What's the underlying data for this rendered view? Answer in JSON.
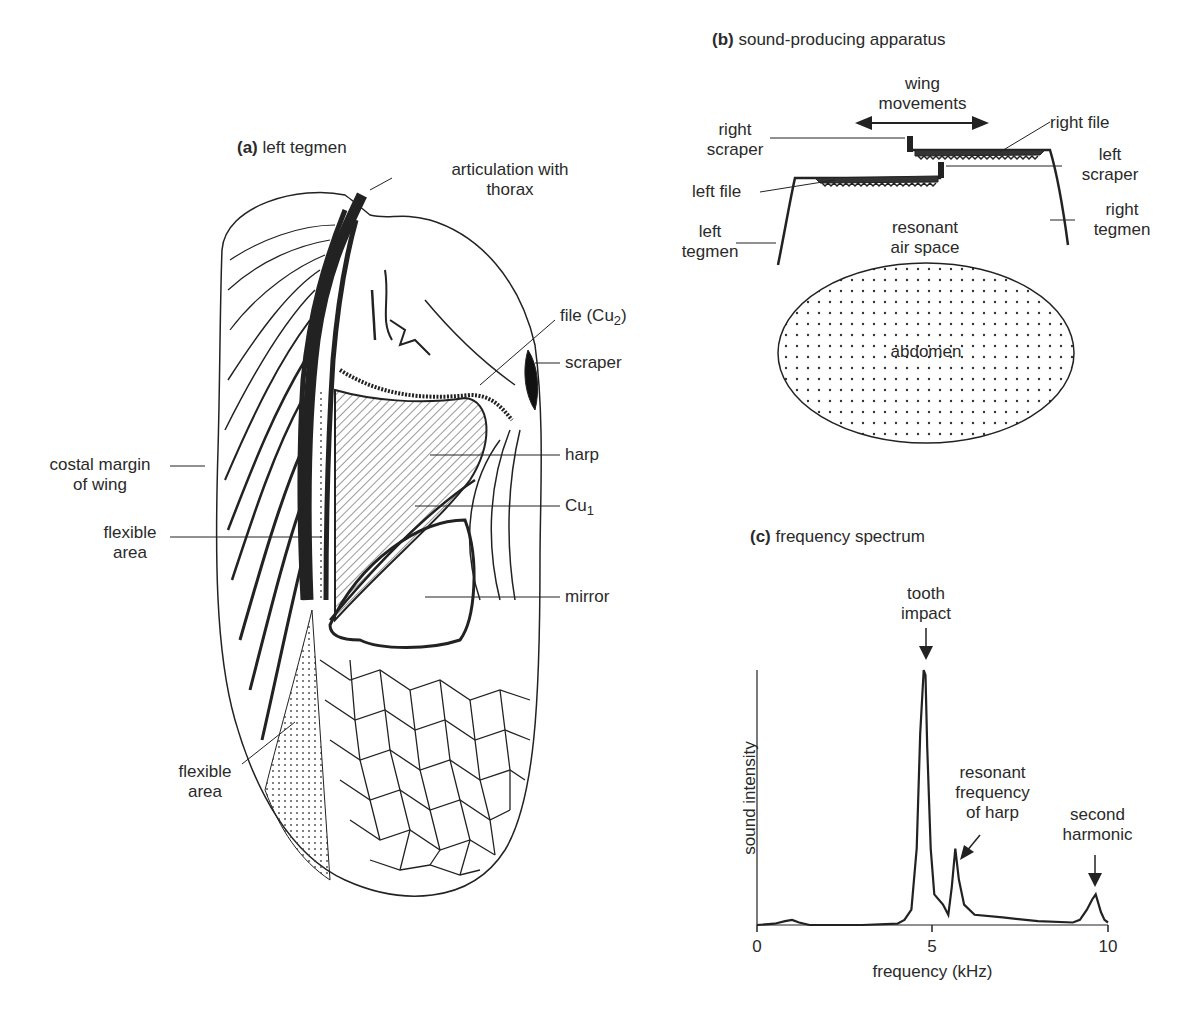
{
  "panel_a": {
    "title_prefix": "(a)",
    "title": "left tegmen",
    "labels": {
      "articulation_1": "articulation with",
      "articulation_2": "thorax",
      "file": "file (Cu",
      "file_sub": "2",
      "file_close": ")",
      "scraper": "scraper",
      "harp": "harp",
      "cu1": "Cu",
      "cu1_sub": "1",
      "mirror": "mirror",
      "costal_1": "costal margin",
      "costal_2": "of wing",
      "flexible_upper_1": "flexible",
      "flexible_upper_2": "area",
      "flexible_lower_1": "flexible",
      "flexible_lower_2": "area"
    }
  },
  "panel_b": {
    "title_prefix": "(b)",
    "title": "sound-producing apparatus",
    "labels": {
      "wing_movements_1": "wing",
      "wing_movements_2": "movements",
      "right_scraper_1": "right",
      "right_scraper_2": "scraper",
      "right_file": "right file",
      "left_scraper_1": "left",
      "left_scraper_2": "scraper",
      "left_file": "left file",
      "left_tegmen_1": "left",
      "left_tegmen_2": "tegmen",
      "right_tegmen_1": "right",
      "right_tegmen_2": "tegmen",
      "resonant_1": "resonant",
      "resonant_2": "air space",
      "abdomen": "abdomen"
    }
  },
  "panel_c": {
    "title_prefix": "(c)",
    "title": "frequency spectrum",
    "annotations": {
      "tooth_1": "tooth",
      "tooth_2": "impact",
      "harp_1": "resonant",
      "harp_2": "frequency",
      "harp_3": "of harp",
      "harmonic_1": "second",
      "harmonic_2": "harmonic"
    },
    "xlabel": "frequency (kHz)",
    "ylabel": "sound intensity",
    "ticks": [
      "0",
      "5",
      "10"
    ]
  },
  "chart_data": {
    "type": "line",
    "title": "frequency spectrum",
    "xlabel": "frequency (kHz)",
    "ylabel": "sound intensity",
    "xlim": [
      0,
      10
    ],
    "ylim": [
      0,
      1
    ],
    "x_ticks": [
      0,
      5,
      10
    ],
    "grid": false,
    "series": [
      {
        "name": "cricket song spectrum",
        "x": [
          0,
          0.5,
          0.8,
          1.0,
          1.2,
          1.5,
          2.0,
          3.0,
          4.0,
          4.2,
          4.4,
          4.55,
          4.65,
          4.75,
          4.8,
          4.85,
          4.95,
          5.05,
          5.3,
          5.45,
          5.55,
          5.65,
          5.75,
          5.9,
          6.2,
          7.0,
          8.0,
          9.0,
          9.2,
          9.4,
          9.55,
          9.65,
          9.8,
          9.9,
          10.0
        ],
        "y": [
          0.0,
          0.005,
          0.015,
          0.02,
          0.01,
          0.0,
          0.0,
          0.0,
          0.005,
          0.02,
          0.06,
          0.3,
          0.75,
          1.0,
          0.98,
          0.7,
          0.3,
          0.12,
          0.08,
          0.04,
          0.15,
          0.3,
          0.18,
          0.08,
          0.04,
          0.03,
          0.015,
          0.01,
          0.02,
          0.06,
          0.1,
          0.12,
          0.05,
          0.02,
          0.01
        ]
      }
    ],
    "annotations": [
      {
        "text": "tooth impact",
        "x": 4.8
      },
      {
        "text": "resonant frequency of harp",
        "x": 5.65
      },
      {
        "text": "second harmonic",
        "x": 9.6
      }
    ]
  }
}
